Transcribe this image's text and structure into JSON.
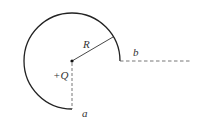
{
  "diagram": {
    "center": {
      "x": 72,
      "y": 61
    },
    "radius": 48,
    "arc": {
      "start_point": "a (bottom)",
      "end_point": "b (right)",
      "sweep_degrees": 270
    },
    "labels": {
      "radius": "R",
      "charge": "+Q",
      "point_a": "a",
      "point_b": "b"
    },
    "colors": {
      "stroke": "#222222",
      "dashed": "#555555",
      "text": "#333333"
    }
  }
}
